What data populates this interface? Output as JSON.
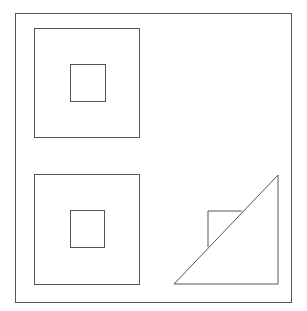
{
  "canvas": {
    "width": 307,
    "height": 311,
    "background": "#ffffff"
  },
  "stroke": {
    "color": "#555555",
    "width": 1
  },
  "frame": {
    "x": 15,
    "y": 13,
    "width": 276,
    "height": 289
  },
  "panels": [
    {
      "name": "top-left",
      "outer_square": {
        "x": 34,
        "y": 28,
        "width": 105,
        "height": 109
      },
      "inner_square": {
        "x": 70,
        "y": 64,
        "width": 35,
        "height": 37
      }
    },
    {
      "name": "bottom-left",
      "outer_square": {
        "x": 34,
        "y": 174,
        "width": 105,
        "height": 110
      },
      "inner_square": {
        "x": 70,
        "y": 210,
        "width": 34,
        "height": 37
      }
    },
    {
      "name": "bottom-right",
      "triangle": {
        "points": "278,175 278,284 174,284"
      },
      "partial_square": {
        "points": "208,247 208,211 242,211"
      }
    }
  ]
}
